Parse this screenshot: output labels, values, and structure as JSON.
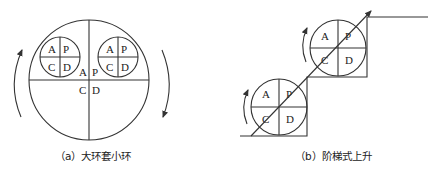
{
  "figure_a": {
    "caption": "（a）大环套小环",
    "big_circle": {
      "labels": [
        "A",
        "P",
        "C",
        "D"
      ]
    },
    "small_circle_left": {
      "labels": [
        "A",
        "P",
        "C",
        "D"
      ]
    },
    "small_circle_right": {
      "labels": [
        "A",
        "P",
        "C",
        "D"
      ]
    },
    "arrows": [
      "counterclockwise-left",
      "clockwise-right"
    ]
  },
  "figure_b": {
    "caption": "（b）阶梯式上升",
    "lower_circle": {
      "labels": [
        "A",
        "P",
        "C",
        "D"
      ]
    },
    "upper_circle": {
      "labels": [
        "A",
        "P",
        "C",
        "D"
      ]
    },
    "staircase": "two-step ascending",
    "diagonal_arrow": "upward trend"
  },
  "colors": {
    "line": "#333333",
    "text": "#222222",
    "background": "#ffffff"
  }
}
